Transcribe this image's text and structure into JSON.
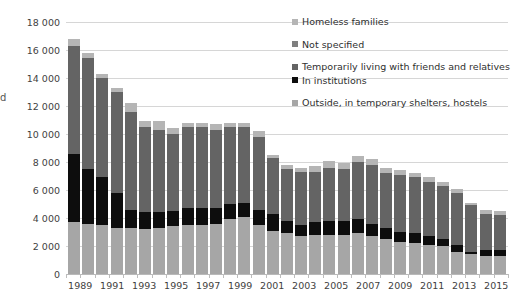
{
  "axis_title_fragment": "d",
  "chart_data": {
    "type": "bar",
    "subtype": "stacked-column",
    "title": "",
    "xlabel": "",
    "ylabel": "",
    "ylim": [
      0,
      18000
    ],
    "ytick_step": 2000,
    "grid": true,
    "legend_position": "right",
    "ytick_labels": [
      "18 000",
      "16 000",
      "14 000",
      "12 000",
      "10 000",
      "8 000",
      "6 000",
      "4 000",
      "2 000",
      "0"
    ],
    "ytick_values": [
      18000,
      16000,
      14000,
      12000,
      10000,
      8000,
      6000,
      4000,
      2000,
      0
    ],
    "categories": [
      "1989",
      "1990",
      "1991",
      "1992",
      "1993",
      "1994",
      "1995",
      "1996",
      "1997",
      "1998",
      "1999",
      "2000",
      "2001",
      "2002",
      "2003",
      "2004",
      "2005",
      "2006",
      "2007",
      "2008",
      "2009",
      "2010",
      "2011",
      "2012",
      "2013",
      "2014",
      "2015",
      "2016",
      "2017",
      "2018",
      "2019"
    ],
    "xtick_labels_shown": [
      "1989",
      "",
      "1991",
      "",
      "1993",
      "",
      "1995",
      "",
      "1997",
      "",
      "1999",
      "",
      "2001",
      "",
      "2003",
      "",
      "2005",
      "",
      "2007",
      "",
      "2009",
      "",
      "2011",
      "",
      "2013",
      "",
      "2015",
      "",
      "2017",
      "",
      "2019"
    ],
    "colors": {
      "outside_shelters": "#a6a6a6",
      "in_institutions": "#0d0d0d",
      "friends_relatives": "#646464",
      "not_specified": "#7f7f7f",
      "homeless_families": "#b5b5b5"
    },
    "series": [
      {
        "name": "Outside, in temporary shelters, hostels",
        "color": "#a6a6a6",
        "stack_order": 1,
        "values": [
          3700,
          3600,
          3500,
          3300,
          3300,
          3200,
          3300,
          3400,
          3500,
          3500,
          3600,
          3900,
          4100,
          3500,
          3100,
          2900,
          2700,
          2800,
          2800,
          2800,
          2900,
          2700,
          2500,
          2300,
          2200,
          2100,
          2000,
          1600,
          1400,
          1300,
          1300
        ]
      },
      {
        "name": "In institutions",
        "color": "#0d0d0d",
        "stack_order": 2,
        "values": [
          4900,
          3900,
          3400,
          2500,
          1300,
          1200,
          1100,
          1100,
          1200,
          1200,
          1100,
          1100,
          1000,
          1100,
          1200,
          900,
          800,
          900,
          1000,
          1000,
          1000,
          900,
          800,
          700,
          700,
          600,
          500,
          500,
          200,
          400,
          400
        ]
      },
      {
        "name": "Temporarily living with friends and relatives",
        "color": "#646464",
        "stack_order": 3,
        "values": [
          7700,
          7900,
          7100,
          7200,
          7000,
          6100,
          5900,
          5500,
          5800,
          5800,
          5600,
          5500,
          5400,
          5200,
          4000,
          3700,
          3800,
          3600,
          3800,
          3700,
          4100,
          4200,
          3900,
          4100,
          4000,
          3900,
          3800,
          3700,
          3300,
          2600,
          2500
        ]
      },
      {
        "name": "Not specified",
        "color": "#7f7f7f",
        "stack_order": 4,
        "values": [
          0,
          0,
          0,
          0,
          0,
          0,
          0,
          0,
          0,
          0,
          0,
          0,
          0,
          0,
          0,
          0,
          0,
          0,
          0,
          0,
          0,
          0,
          0,
          0,
          0,
          0,
          0,
          0,
          0,
          0,
          0
        ]
      },
      {
        "name": "Homeless families",
        "color": "#b5b5b5",
        "stack_order": 5,
        "values": [
          500,
          400,
          300,
          300,
          600,
          400,
          600,
          400,
          300,
          300,
          400,
          300,
          300,
          400,
          200,
          300,
          300,
          400,
          500,
          400,
          400,
          400,
          400,
          300,
          300,
          300,
          300,
          300,
          200,
          300,
          300
        ]
      }
    ],
    "totals": [
      16800,
      15800,
      14300,
      13300,
      12200,
      10900,
      10900,
      10400,
      10800,
      10800,
      10700,
      10800,
      10800,
      10200,
      8500,
      7800,
      7600,
      7700,
      8100,
      7900,
      8400,
      8200,
      7600,
      7400,
      7200,
      6900,
      6600,
      6100,
      5100,
      4600,
      4500
    ],
    "legend": [
      {
        "label": "Homeless families",
        "color": "#b5b5b5"
      },
      {
        "label": "Not specified",
        "color": "#7f7f7f"
      },
      {
        "label": "Temporarily living with friends and relatives",
        "color": "#646464"
      },
      {
        "label": "In institutions",
        "color": "#0d0d0d"
      },
      {
        "label": "Outside, in temporary shelters, hostels",
        "color": "#a6a6a6"
      }
    ]
  }
}
